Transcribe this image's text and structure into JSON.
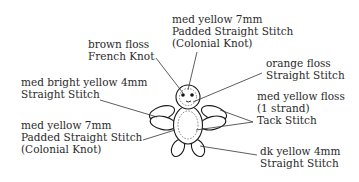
{
  "diagram": {
    "labels": {
      "top_center": {
        "line1": "med yellow  7mm",
        "line2": "Padded Straight Stitch",
        "line3": "(Colonial Knot)"
      },
      "brown_floss": {
        "line1": "brown floss",
        "line2": "French Knot"
      },
      "orange_floss": {
        "line1": "orange floss",
        "line2": "Straight Stitch"
      },
      "med_bright_yellow": {
        "line1": "med bright yellow  4mm",
        "line2": "Straight Stitch"
      },
      "tack_stitch": {
        "line1": "med yellow floss",
        "line2": "(1 strand)",
        "line3": "Tack Stitch"
      },
      "left_bottom": {
        "line1": "med yellow  7mm",
        "line2": "Padded Straight Stitch",
        "line3": "(Colonial Knot)"
      },
      "dk_yellow": {
        "line1": "dk yellow  4mm",
        "line2": "Straight Stitch"
      }
    },
    "colors": {
      "background": "#ffffff",
      "ink": "#1a1a1a",
      "text": "#2a2a2a"
    }
  }
}
